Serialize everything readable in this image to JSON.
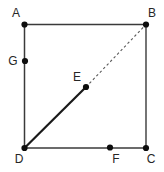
{
  "diagram": {
    "background_color": "#ffffff",
    "edge_color": "#3a3a3a",
    "diagonal_solid_color": "#1a1a1a",
    "diagonal_dashed_color": "#5a5a5a",
    "dot_color": "#0d0d0d",
    "label_color": "#262626",
    "dot_radius": 3.1,
    "label_font_size": 12,
    "points": [
      {
        "id": "A",
        "label": "A",
        "x": 24.5,
        "y": 24.5,
        "label_x": 16,
        "label_y": 17,
        "role": "square-corner-top-left"
      },
      {
        "id": "B",
        "label": "B",
        "x": 146,
        "y": 24.5,
        "label_x": 152,
        "label_y": 17,
        "role": "square-corner-top-right"
      },
      {
        "id": "C",
        "label": "C",
        "x": 146,
        "y": 148,
        "label_x": 151,
        "label_y": 163,
        "role": "square-corner-bottom-right"
      },
      {
        "id": "D",
        "label": "D",
        "x": 24.5,
        "y": 148,
        "label_x": 19,
        "label_y": 163,
        "role": "square-corner-bottom-left"
      },
      {
        "id": "G",
        "label": "G",
        "x": 25,
        "y": 61,
        "label_x": 13,
        "label_y": 65,
        "role": "point-on-left-side"
      },
      {
        "id": "E",
        "label": "E",
        "x": 86,
        "y": 87,
        "label_x": 77,
        "label_y": 81,
        "role": "midpoint-of-diagonal"
      },
      {
        "id": "F",
        "label": "F",
        "x": 110,
        "y": 147.5,
        "label_x": 116,
        "label_y": 163,
        "role": "point-on-bottom-side"
      }
    ],
    "edges": [
      {
        "from": "A",
        "to": "B",
        "style": "solid",
        "width": 1.5,
        "color_key": "edge_color",
        "name": "square-side-top"
      },
      {
        "from": "B",
        "to": "C",
        "style": "solid",
        "width": 1.4,
        "color_key": "edge_color",
        "name": "square-side-right"
      },
      {
        "from": "C",
        "to": "D",
        "style": "solid",
        "width": 1.5,
        "color_key": "edge_color",
        "name": "square-side-bottom"
      },
      {
        "from": "D",
        "to": "A",
        "style": "solid",
        "width": 1.5,
        "color_key": "edge_color",
        "name": "square-side-left"
      },
      {
        "from": "D",
        "to": "E",
        "style": "solid",
        "width": 2.2,
        "color_key": "diagonal_solid_color",
        "name": "diagonal-segment-solid-D-E"
      },
      {
        "from": "E",
        "to": "B",
        "style": "dashed",
        "width": 1.1,
        "color_key": "diagonal_dashed_color",
        "name": "diagonal-segment-dashed-E-B"
      }
    ],
    "dash_pattern": "2.5 2.5"
  }
}
